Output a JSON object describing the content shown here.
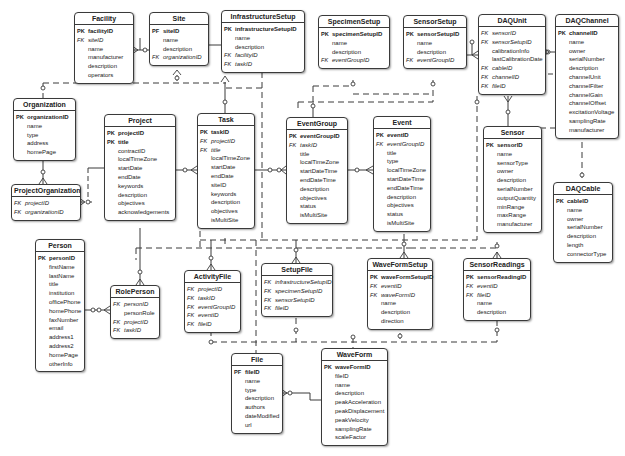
{
  "diagram": {
    "type": "entity-relationship",
    "entities": [
      {
        "name": "Facility",
        "x": 74,
        "y": 12,
        "w": 58,
        "rows": [
          {
            "k": "PK",
            "f": "facilityID"
          },
          {
            "k": "FK",
            "f": "siteID"
          },
          {
            "k": "",
            "f": "name"
          },
          {
            "k": "",
            "f": "manufacturer"
          },
          {
            "k": "",
            "f": "description"
          },
          {
            "k": "",
            "f": "operators"
          }
        ]
      },
      {
        "name": "Site",
        "x": 149,
        "y": 12,
        "w": 58,
        "rows": [
          {
            "k": "PF",
            "f": "siteID"
          },
          {
            "k": "",
            "f": "name"
          },
          {
            "k": "",
            "f": "description"
          },
          {
            "k": "FK",
            "f": "organizationID"
          }
        ]
      },
      {
        "name": "InfrastructureSetup",
        "x": 221,
        "y": 10,
        "w": 82,
        "rows": [
          {
            "k": "PK",
            "f": "infrastructureSetupID"
          },
          {
            "k": "",
            "f": "name"
          },
          {
            "k": "",
            "f": "description"
          },
          {
            "k": "FK",
            "f": "facilityID"
          },
          {
            "k": "FK",
            "f": "taskID"
          }
        ]
      },
      {
        "name": "SpecimenSetup",
        "x": 318,
        "y": 15,
        "w": 70,
        "rows": [
          {
            "k": "PK",
            "f": "specimenSetupID"
          },
          {
            "k": "",
            "f": "name"
          },
          {
            "k": "",
            "f": "description"
          },
          {
            "k": "FK",
            "f": "eventGroupID"
          }
        ]
      },
      {
        "name": "SensorSetup",
        "x": 403,
        "y": 15,
        "w": 62,
        "rows": [
          {
            "k": "PK",
            "f": "sensorSetupID"
          },
          {
            "k": "",
            "f": "name"
          },
          {
            "k": "",
            "f": "description"
          },
          {
            "k": "FK",
            "f": "eventGroupID"
          }
        ]
      },
      {
        "name": "DAQUnit",
        "x": 478,
        "y": 14,
        "w": 66,
        "rows": [
          {
            "k": "FK",
            "f": "sensorID"
          },
          {
            "k": "FK",
            "f": "sensorSetupID"
          },
          {
            "k": "",
            "f": "calibrationInfo"
          },
          {
            "k": "",
            "f": "lastCalibrationDate"
          },
          {
            "k": "FK",
            "f": "cableID"
          },
          {
            "k": "FK",
            "f": "channelID"
          },
          {
            "k": "FK",
            "f": "fileID"
          }
        ]
      },
      {
        "name": "DAQChannel",
        "x": 555,
        "y": 14,
        "w": 62,
        "rows": [
          {
            "k": "PK",
            "f": "channelID"
          },
          {
            "k": "",
            "f": "name"
          },
          {
            "k": "",
            "f": "owner"
          },
          {
            "k": "",
            "f": "serialNumber"
          },
          {
            "k": "",
            "f": "description"
          },
          {
            "k": "",
            "f": "channelUnit"
          },
          {
            "k": "",
            "f": "channelFilter"
          },
          {
            "k": "",
            "f": "channelGain"
          },
          {
            "k": "",
            "f": "channelOffset"
          },
          {
            "k": "",
            "f": "excitationVoltage"
          },
          {
            "k": "",
            "f": "samplingRate"
          },
          {
            "k": "",
            "f": "manufacturer"
          }
        ]
      },
      {
        "name": "Organization",
        "x": 13,
        "y": 98,
        "w": 61,
        "rows": [
          {
            "k": "PK",
            "f": "organizationID"
          },
          {
            "k": "",
            "f": "name"
          },
          {
            "k": "",
            "f": "type"
          },
          {
            "k": "",
            "f": "address"
          },
          {
            "k": "",
            "f": "homePage"
          }
        ]
      },
      {
        "name": "ProjectOrganization",
        "x": 11,
        "y": 184,
        "w": 68,
        "rows": [
          {
            "k": "FK",
            "f": "projectID"
          },
          {
            "k": "FK",
            "f": "organizationID"
          }
        ]
      },
      {
        "name": "Project",
        "x": 104,
        "y": 114,
        "w": 70,
        "rows": [
          {
            "k": "PK",
            "f": "projectID"
          },
          {
            "k": "PK",
            "f": "title"
          },
          {
            "k": "",
            "f": "contractID"
          },
          {
            "k": "",
            "f": "localTimeZone"
          },
          {
            "k": "",
            "f": "startDate"
          },
          {
            "k": "",
            "f": "endDate"
          },
          {
            "k": "",
            "f": "keywords"
          },
          {
            "k": "",
            "f": "description"
          },
          {
            "k": "",
            "f": "objectives"
          },
          {
            "k": "",
            "f": "acknowledgements"
          }
        ]
      },
      {
        "name": "Task",
        "x": 197,
        "y": 113,
        "w": 56,
        "rows": [
          {
            "k": "PK",
            "f": "taskID"
          },
          {
            "k": "FK",
            "f": "projectID"
          },
          {
            "k": "FK",
            "f": "title"
          },
          {
            "k": "",
            "f": "localTimeZone"
          },
          {
            "k": "",
            "f": "startDate"
          },
          {
            "k": "",
            "f": "endDate"
          },
          {
            "k": "",
            "f": "siteID"
          },
          {
            "k": "",
            "f": "keywords"
          },
          {
            "k": "",
            "f": "description"
          },
          {
            "k": "",
            "f": "objectives"
          },
          {
            "k": "",
            "f": "isMultiSite"
          }
        ]
      },
      {
        "name": "EventGroup",
        "x": 286,
        "y": 117,
        "w": 60,
        "rows": [
          {
            "k": "PK",
            "f": "eventGroupID"
          },
          {
            "k": "FK",
            "f": "taskID"
          },
          {
            "k": "",
            "f": "title"
          },
          {
            "k": "",
            "f": "localTimeZone"
          },
          {
            "k": "",
            "f": "startDateTime"
          },
          {
            "k": "",
            "f": "endDateTime"
          },
          {
            "k": "",
            "f": "description"
          },
          {
            "k": "",
            "f": "objectives"
          },
          {
            "k": "",
            "f": "status"
          },
          {
            "k": "",
            "f": "isMultiSite"
          }
        ]
      },
      {
        "name": "Event",
        "x": 373,
        "y": 116,
        "w": 56,
        "rows": [
          {
            "k": "PK",
            "f": "eventID"
          },
          {
            "k": "FK",
            "f": "eventGroupID"
          },
          {
            "k": "",
            "f": "title"
          },
          {
            "k": "",
            "f": "type"
          },
          {
            "k": "",
            "f": "localTimeZone"
          },
          {
            "k": "",
            "f": "startDateTime"
          },
          {
            "k": "",
            "f": "endDateTime"
          },
          {
            "k": "",
            "f": "description"
          },
          {
            "k": "",
            "f": "objectives"
          },
          {
            "k": "",
            "f": "status"
          },
          {
            "k": "",
            "f": "isMultiSite"
          }
        ]
      },
      {
        "name": "Sensor",
        "x": 483,
        "y": 126,
        "w": 57,
        "rows": [
          {
            "k": "PK",
            "f": "sensorID"
          },
          {
            "k": "",
            "f": "name"
          },
          {
            "k": "",
            "f": "sensorType"
          },
          {
            "k": "",
            "f": "owner"
          },
          {
            "k": "",
            "f": "description"
          },
          {
            "k": "",
            "f": "serialNumber"
          },
          {
            "k": "",
            "f": "outputQuantity"
          },
          {
            "k": "",
            "f": "minRange"
          },
          {
            "k": "",
            "f": "maxRange"
          },
          {
            "k": "",
            "f": "manufacturer"
          }
        ]
      },
      {
        "name": "DAQCable",
        "x": 553,
        "y": 182,
        "w": 58,
        "rows": [
          {
            "k": "PK",
            "f": "cableID"
          },
          {
            "k": "",
            "f": "name"
          },
          {
            "k": "",
            "f": "owner"
          },
          {
            "k": "",
            "f": "serialNumber"
          },
          {
            "k": "",
            "f": "description"
          },
          {
            "k": "",
            "f": "length"
          },
          {
            "k": "",
            "f": "connectorType"
          }
        ]
      },
      {
        "name": "Person",
        "x": 35,
        "y": 239,
        "w": 48,
        "rows": [
          {
            "k": "PK",
            "f": "personID"
          },
          {
            "k": "",
            "f": "firstName"
          },
          {
            "k": "",
            "f": "lastName"
          },
          {
            "k": "",
            "f": "title"
          },
          {
            "k": "",
            "f": "institution"
          },
          {
            "k": "",
            "f": "officePhone"
          },
          {
            "k": "",
            "f": "homePhone"
          },
          {
            "k": "",
            "f": "faxNumber"
          },
          {
            "k": "",
            "f": "email"
          },
          {
            "k": "",
            "f": "address1"
          },
          {
            "k": "",
            "f": "address2"
          },
          {
            "k": "",
            "f": "homePage"
          },
          {
            "k": "",
            "f": "otherInfo"
          }
        ]
      },
      {
        "name": "RolePerson",
        "x": 110,
        "y": 285,
        "w": 48,
        "rows": [
          {
            "k": "FK",
            "f": "personID"
          },
          {
            "k": "",
            "f": "personRole"
          },
          {
            "k": "FK",
            "f": "projectID"
          },
          {
            "k": "FK",
            "f": "taskID"
          }
        ]
      },
      {
        "name": "ActivityFile",
        "x": 184,
        "y": 270,
        "w": 55,
        "rows": [
          {
            "k": "FK",
            "f": "projectID"
          },
          {
            "k": "FK",
            "f": "taskID"
          },
          {
            "k": "FK",
            "f": "eventGroupID"
          },
          {
            "k": "FK",
            "f": "eventID"
          },
          {
            "k": "FK",
            "f": "fileID"
          }
        ]
      },
      {
        "name": "SetupFile",
        "x": 261,
        "y": 263,
        "w": 70,
        "rows": [
          {
            "k": "FK",
            "f": "infrastructureSetupID"
          },
          {
            "k": "FK",
            "f": "specimenSetupID"
          },
          {
            "k": "FK",
            "f": "sensorSetupID"
          },
          {
            "k": "FK",
            "f": "fileID"
          }
        ]
      },
      {
        "name": "WaveFormSetup",
        "x": 367,
        "y": 258,
        "w": 64,
        "rows": [
          {
            "k": "PK",
            "f": "waveFormSetupID"
          },
          {
            "k": "FK",
            "f": "eventID"
          },
          {
            "k": "FK",
            "f": "waveFormID"
          },
          {
            "k": "",
            "f": "name"
          },
          {
            "k": "",
            "f": "description"
          },
          {
            "k": "",
            "f": "direction"
          }
        ]
      },
      {
        "name": "SensorReadings",
        "x": 463,
        "y": 258,
        "w": 66,
        "rows": [
          {
            "k": "PK",
            "f": "sensorReadingID"
          },
          {
            "k": "FK",
            "f": "eventID"
          },
          {
            "k": "FK",
            "f": "fileID"
          },
          {
            "k": "",
            "f": "name"
          },
          {
            "k": "",
            "f": "description"
          }
        ]
      },
      {
        "name": "File",
        "x": 231,
        "y": 353,
        "w": 50,
        "rows": [
          {
            "k": "PF",
            "f": "fileID"
          },
          {
            "k": "",
            "f": "name"
          },
          {
            "k": "",
            "f": "type"
          },
          {
            "k": "",
            "f": "description"
          },
          {
            "k": "",
            "f": "authors"
          },
          {
            "k": "",
            "f": "dateModified"
          },
          {
            "k": "",
            "f": "url"
          }
        ]
      },
      {
        "name": "WaveForm",
        "x": 321,
        "y": 348,
        "w": 65,
        "rows": [
          {
            "k": "PK",
            "f": "waveFormID"
          },
          {
            "k": "",
            "f": "fileID"
          },
          {
            "k": "",
            "f": "name"
          },
          {
            "k": "",
            "f": "description"
          },
          {
            "k": "",
            "f": "peakAcceleration"
          },
          {
            "k": "",
            "f": "peakDisplacement"
          },
          {
            "k": "",
            "f": "peakVelocity"
          },
          {
            "k": "",
            "f": "samplingRate"
          },
          {
            "k": "",
            "f": "scaleFactor"
          }
        ]
      }
    ],
    "relationships": [
      {
        "from": "Site",
        "to": "Facility",
        "style": "solid"
      },
      {
        "from": "Site",
        "to": "Organization",
        "style": "dashed"
      },
      {
        "from": "Site",
        "to": "InfrastructureSetup",
        "style": "solid"
      },
      {
        "from": "Organization",
        "to": "ProjectOrganization",
        "style": "solid"
      },
      {
        "from": "Project",
        "to": "ProjectOrganization",
        "style": "dashed"
      },
      {
        "from": "Project",
        "to": "Task",
        "style": "solid"
      },
      {
        "from": "Task",
        "to": "InfrastructureSetup",
        "style": "dashed"
      },
      {
        "from": "Task",
        "to": "EventGroup",
        "style": "solid"
      },
      {
        "from": "EventGroup",
        "to": "Event",
        "style": "solid"
      },
      {
        "from": "EventGroup",
        "to": "SpecimenSetup",
        "style": "dashed"
      },
      {
        "from": "EventGroup",
        "to": "SensorSetup",
        "style": "dashed"
      },
      {
        "from": "SensorSetup",
        "to": "DAQUnit",
        "style": "solid"
      },
      {
        "from": "DAQChannel",
        "to": "DAQUnit",
        "style": "solid"
      },
      {
        "from": "Sensor",
        "to": "DAQUnit",
        "style": "solid"
      },
      {
        "from": "DAQCable",
        "to": "DAQUnit",
        "style": "dashed"
      },
      {
        "from": "Person",
        "to": "RolePerson",
        "style": "solid"
      },
      {
        "from": "Project",
        "to": "RolePerson",
        "style": "dashed"
      },
      {
        "from": "Project",
        "to": "ActivityFile",
        "style": "dashed"
      },
      {
        "from": "Task",
        "to": "ActivityFile",
        "style": "dashed"
      },
      {
        "from": "InfrastructureSetup",
        "to": "SetupFile",
        "style": "dashed"
      },
      {
        "from": "SpecimenSetup",
        "to": "SetupFile",
        "style": "dashed"
      },
      {
        "from": "SensorSetup",
        "to": "SetupFile",
        "style": "dashed"
      },
      {
        "from": "Event",
        "to": "WaveFormSetup",
        "style": "solid"
      },
      {
        "from": "Event",
        "to": "SensorReadings",
        "style": "dashed"
      },
      {
        "from": "File",
        "to": "ActivityFile",
        "style": "dashed"
      },
      {
        "from": "File",
        "to": "SetupFile",
        "style": "dashed"
      },
      {
        "from": "File",
        "to": "WaveForm",
        "style": "solid"
      },
      {
        "from": "WaveForm",
        "to": "WaveFormSetup",
        "style": "dashed"
      },
      {
        "from": "File",
        "to": "SensorReadings",
        "style": "dashed"
      }
    ],
    "colors": {
      "line": "#3a3a3a",
      "border": "#3a3a3a",
      "background": "#ffffff",
      "text": "#222222"
    }
  }
}
